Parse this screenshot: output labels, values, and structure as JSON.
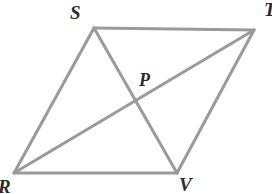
{
  "figure": {
    "type": "geometry-diagram",
    "shape": "parallelogram",
    "width": 272,
    "height": 194,
    "background_color": "#ffffff",
    "stroke_color": "#9a9a9a",
    "stroke_width": 3,
    "label_color": "#2b2b2b",
    "points": {
      "S": {
        "label": "S",
        "x": 94,
        "y": 28
      },
      "T": {
        "label": "T",
        "x": 254,
        "y": 30
      },
      "R": {
        "label": "R",
        "x": 14,
        "y": 173
      },
      "V": {
        "label": "V",
        "x": 177,
        "y": 173
      },
      "P": {
        "label": "P",
        "x": 135,
        "y": 99
      }
    },
    "segments": [
      {
        "name": "side-SR",
        "from": "S",
        "to": "R"
      },
      {
        "name": "side-ST",
        "from": "S",
        "to": "T"
      },
      {
        "name": "side-TV",
        "from": "T",
        "to": "V"
      },
      {
        "name": "side-RV",
        "from": "R",
        "to": "V"
      },
      {
        "name": "diagonal-RT",
        "from": "R",
        "to": "T"
      },
      {
        "name": "diagonal-SV",
        "from": "S",
        "to": "V"
      }
    ],
    "labels": [
      {
        "name": "vertex-label-s",
        "text": "S",
        "clipped": false
      },
      {
        "name": "vertex-label-t",
        "text": "T",
        "clipped": true
      },
      {
        "name": "vertex-label-r",
        "text": "R",
        "clipped": true
      },
      {
        "name": "vertex-label-v",
        "text": "V",
        "clipped": true
      },
      {
        "name": "point-label-p",
        "text": "P",
        "clipped": false
      }
    ]
  }
}
